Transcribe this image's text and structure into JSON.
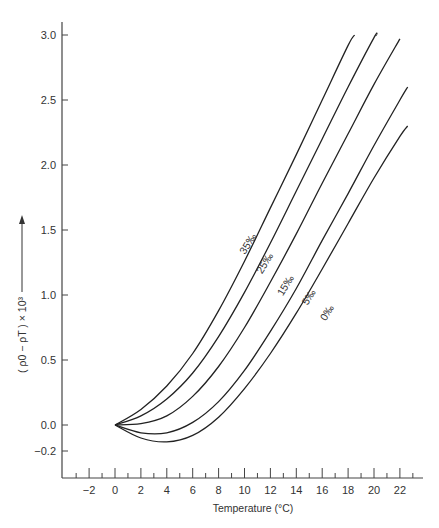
{
  "chart_data": {
    "type": "line",
    "title": "",
    "xlabel": "Temperature (°C)",
    "ylabel": "( ρ0 − ρT ) × 10³",
    "xlim": [
      -3.5,
      23.5
    ],
    "ylim": [
      -0.42,
      3.1
    ],
    "grid": false,
    "legend": "inline curve labels",
    "x_ticks": [
      -2,
      0,
      2,
      4,
      6,
      8,
      10,
      12,
      14,
      16,
      18,
      20,
      22
    ],
    "x_tick_labels": [
      "−2",
      "0",
      "2",
      "4",
      "6",
      "8",
      "10",
      "12",
      "14",
      "16",
      "18",
      "20",
      "22"
    ],
    "x_minor_ticks": [
      -3,
      -1,
      1,
      3,
      5,
      7,
      9,
      11,
      13,
      15,
      17,
      19,
      21,
      23
    ],
    "y_ticks": [
      -0.2,
      0.0,
      0.5,
      1.0,
      1.5,
      2.0,
      2.5,
      3.0
    ],
    "y_tick_labels": [
      "−0.2",
      "0.0",
      "0.5",
      "1.0",
      "1.5",
      "2.0",
      "2.5",
      "3.0"
    ],
    "series": [
      {
        "name": "35‰",
        "label": "35‰",
        "x": [
          0,
          2,
          4,
          6,
          8,
          10,
          12,
          14,
          16,
          18,
          18.5
        ],
        "y": [
          0.0,
          0.12,
          0.3,
          0.55,
          0.88,
          1.26,
          1.67,
          2.08,
          2.5,
          2.92,
          3.0
        ]
      },
      {
        "name": "25‰",
        "label": "25‰",
        "x": [
          0,
          2,
          4,
          6,
          8,
          10,
          12,
          14,
          16,
          18,
          20,
          20.2
        ],
        "y": [
          0.0,
          0.07,
          0.2,
          0.4,
          0.68,
          1.02,
          1.4,
          1.8,
          2.2,
          2.6,
          2.98,
          3.0
        ]
      },
      {
        "name": "15‰",
        "label": "15‰",
        "x": [
          0,
          2,
          4,
          6,
          8,
          10,
          12,
          14,
          16,
          18,
          20,
          22
        ],
        "y": [
          0.0,
          0.01,
          0.07,
          0.22,
          0.45,
          0.75,
          1.1,
          1.47,
          1.86,
          2.24,
          2.62,
          2.97
        ]
      },
      {
        "name": "5‰",
        "label": "5‰",
        "x": [
          0,
          2,
          4,
          6,
          8,
          10,
          12,
          14,
          16,
          18,
          20,
          22,
          22.6
        ],
        "y": [
          0.0,
          -0.06,
          -0.06,
          0.02,
          0.18,
          0.42,
          0.72,
          1.05,
          1.42,
          1.78,
          2.15,
          2.5,
          2.6
        ]
      },
      {
        "name": "0‰",
        "label": "0‰",
        "x": [
          0,
          2,
          4,
          6,
          8,
          10,
          12,
          14,
          16,
          18,
          20,
          22,
          22.6
        ],
        "y": [
          0.0,
          -0.1,
          -0.13,
          -0.08,
          0.06,
          0.28,
          0.55,
          0.86,
          1.2,
          1.55,
          1.9,
          2.22,
          2.3
        ]
      }
    ],
    "label_positions": [
      {
        "name": "35‰",
        "x": 10.5,
        "y": 1.38
      },
      {
        "name": "25‰",
        "x": 11.8,
        "y": 1.23
      },
      {
        "name": "15‰",
        "x": 13.4,
        "y": 1.06
      },
      {
        "name": "5‰",
        "x": 15.2,
        "y": 0.97
      },
      {
        "name": "0‰",
        "x": 16.6,
        "y": 0.85
      }
    ]
  }
}
